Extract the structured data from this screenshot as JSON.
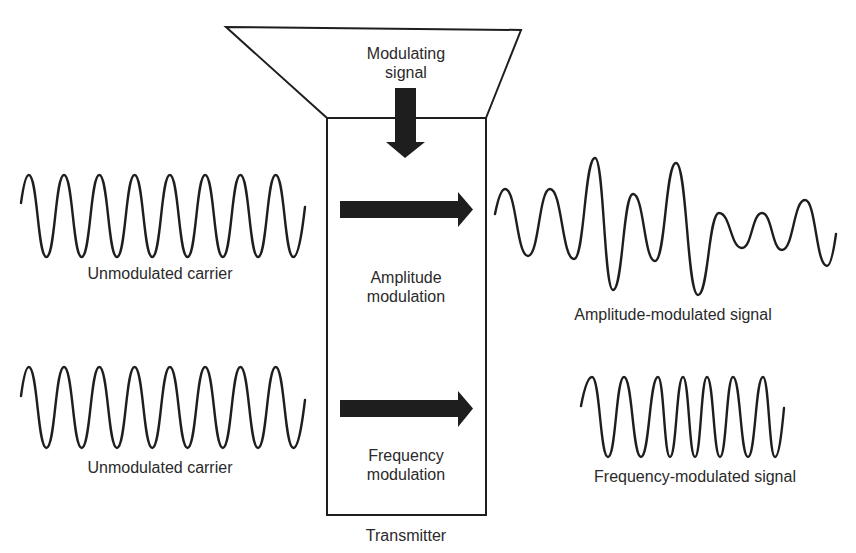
{
  "colors": {
    "ink": "#1e1e1e",
    "text": "#2a2a2a",
    "background": "#ffffff"
  },
  "funnel": {
    "label_line1": "Modulating",
    "label_line2": "signal"
  },
  "transmitter": {
    "label": "Transmitter",
    "am_label_line1": "Amplitude",
    "am_label_line2": "modulation",
    "fm_label_line1": "Frequency",
    "fm_label_line2": "modulation"
  },
  "left": {
    "carrier_top_label": "Unmodulated carrier",
    "carrier_bottom_label": "Unmodulated carrier"
  },
  "right": {
    "am_label": "Amplitude-modulated signal",
    "fm_label": "Frequency-modulated signal"
  },
  "icons": {
    "down_arrow": "arrow-down-icon",
    "right_arrow_am": "arrow-right-icon",
    "right_arrow_fm": "arrow-right-icon"
  }
}
